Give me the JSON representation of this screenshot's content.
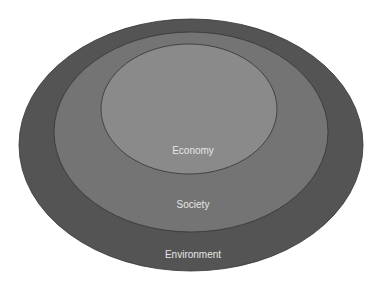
{
  "diagram": {
    "type": "nested-ellipses",
    "layers": [
      {
        "label": "Environment",
        "color": "#545454",
        "cx": 191,
        "cy": 145,
        "rx": 172,
        "ry": 126,
        "label_y": 258
      },
      {
        "label": "Society",
        "color": "#747474",
        "cx": 191,
        "cy": 132,
        "rx": 137,
        "ry": 100,
        "label_y": 208
      },
      {
        "label": "Economy",
        "color": "#8a8a8a",
        "cx": 189,
        "cy": 109,
        "rx": 88,
        "ry": 65,
        "label_y": 154
      }
    ],
    "stroke": "#333333"
  }
}
